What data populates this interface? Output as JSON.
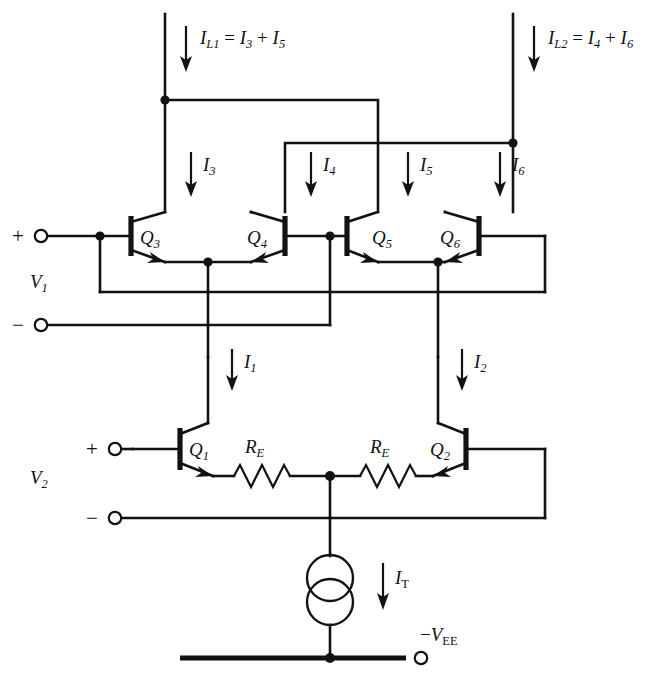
{
  "figure": {
    "type": "circuit-schematic",
    "ink_color": "#121212",
    "background_color": "#ffffff"
  },
  "labels": {
    "load_current_left": {
      "symbol": "I",
      "sub": "L1",
      "equals": "=",
      "term1": "I",
      "term1_sub": "3",
      "plus": "+",
      "term2": "I",
      "term2_sub": "5"
    },
    "load_current_right": {
      "symbol": "I",
      "sub": "L2",
      "equals": "=",
      "term1": "I",
      "term1_sub": "4",
      "plus": "+",
      "term2": "I",
      "term2_sub": "6"
    },
    "i3": {
      "symbol": "I",
      "sub": "3"
    },
    "i4": {
      "symbol": "I",
      "sub": "4"
    },
    "i5": {
      "symbol": "I",
      "sub": "5"
    },
    "i6": {
      "symbol": "I",
      "sub": "6"
    },
    "i1": {
      "symbol": "I",
      "sub": "1"
    },
    "i2": {
      "symbol": "I",
      "sub": "2"
    },
    "it": {
      "symbol": "I",
      "sub": "T"
    },
    "vee": {
      "minus": "−",
      "symbol": "V",
      "sub": "EE"
    },
    "v1": {
      "symbol": "V",
      "sub": "1"
    },
    "v2": {
      "symbol": "V",
      "sub": "2"
    }
  },
  "transistors": [
    {
      "name": "q3",
      "symbol": "Q",
      "sub": "3",
      "type": "npn"
    },
    {
      "name": "q4",
      "symbol": "Q",
      "sub": "4",
      "type": "npn"
    },
    {
      "name": "q5",
      "symbol": "Q",
      "sub": "5",
      "type": "npn"
    },
    {
      "name": "q6",
      "symbol": "Q",
      "sub": "6",
      "type": "npn"
    },
    {
      "name": "q1",
      "symbol": "Q",
      "sub": "1",
      "type": "npn"
    },
    {
      "name": "q2",
      "symbol": "Q",
      "sub": "2",
      "type": "npn"
    }
  ],
  "resistors": [
    {
      "name": "re-left",
      "symbol": "R",
      "sub": "E"
    },
    {
      "name": "re-right",
      "symbol": "R",
      "sub": "E"
    }
  ],
  "terminals": [
    {
      "name": "v1-plus",
      "sign": "+"
    },
    {
      "name": "v1-minus",
      "sign": "−"
    },
    {
      "name": "v2-plus",
      "sign": "+"
    },
    {
      "name": "v2-minus",
      "sign": "−"
    },
    {
      "name": "vee-terminal",
      "sign": ""
    }
  ],
  "sources": [
    {
      "name": "tail-current-source",
      "style": "double-circle",
      "current": "I_T"
    }
  ]
}
